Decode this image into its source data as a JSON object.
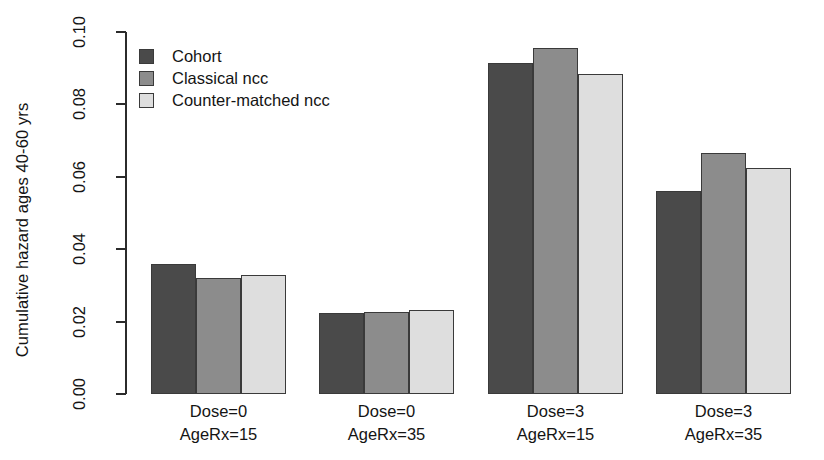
{
  "chart_data": {
    "type": "bar",
    "title": "",
    "xlabel": "",
    "ylabel": "Cumulative hazard ages 40-60 yrs",
    "ylim": [
      0.0,
      0.1
    ],
    "ytick_labels": [
      "0.00",
      "0.02",
      "0.04",
      "0.06",
      "0.08",
      "0.10"
    ],
    "ytick_values": [
      0.0,
      0.02,
      0.04,
      0.06,
      0.08,
      0.1
    ],
    "grid": false,
    "legend_position": "top-left",
    "categories": [
      "Dose=0 AgeRx=15",
      "Dose=0 AgeRx=35",
      "Dose=3 AgeRx=15",
      "Dose=3 AgeRx=35"
    ],
    "category_lines": [
      {
        "line1": "Dose=0",
        "line2": "AgeRx=15"
      },
      {
        "line1": "Dose=0",
        "line2": "AgeRx=35"
      },
      {
        "line1": "Dose=3",
        "line2": "AgeRx=15"
      },
      {
        "line1": "Dose=3",
        "line2": "AgeRx=35"
      }
    ],
    "series": [
      {
        "name": "Cohort",
        "color": "#4a4a4a",
        "values": [
          0.036,
          0.0225,
          0.0915,
          0.056
        ]
      },
      {
        "name": "Classical ncc",
        "color": "#8c8c8c",
        "values": [
          0.032,
          0.0227,
          0.0955,
          0.0665
        ]
      },
      {
        "name": "Counter-matched ncc",
        "color": "#dedede",
        "values": [
          0.033,
          0.0233,
          0.0885,
          0.0625
        ]
      }
    ]
  },
  "legend": {
    "items": [
      {
        "label": "Cohort",
        "color": "#4a4a4a"
      },
      {
        "label": "Classical ncc",
        "color": "#8c8c8c"
      },
      {
        "label": "Counter-matched ncc",
        "color": "#dedede"
      }
    ]
  },
  "axis": {
    "y_title": "Cumulative hazard ages 40-60 yrs"
  }
}
